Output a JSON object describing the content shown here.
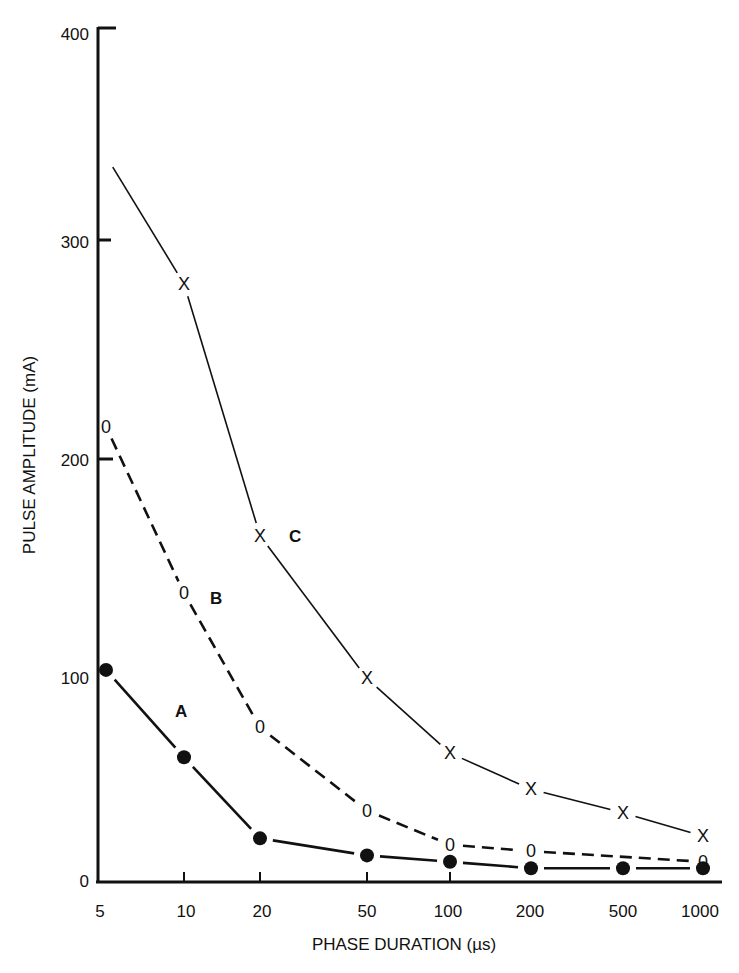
{
  "chart_data": {
    "type": "line",
    "title": "",
    "xlabel": "PHASE DURATION (µs)",
    "ylabel": "PULSE AMPLITUDE (mA)",
    "x_scale": "log",
    "x": [
      5,
      10,
      20,
      50,
      100,
      200,
      500,
      1000
    ],
    "x_tick_labels": [
      "5",
      "10",
      "20",
      "50",
      "100",
      "200",
      "500",
      "1000"
    ],
    "y_tick_labels": [
      "0",
      "100",
      "200",
      "300",
      "400"
    ],
    "ylim": [
      0,
      400
    ],
    "grid": false,
    "legend": "inline labels",
    "series": [
      {
        "name": "A",
        "marker": "filled-circle",
        "line": "solid",
        "values": [
          99,
          58,
          20,
          12,
          9,
          6,
          6,
          6
        ]
      },
      {
        "name": "B",
        "marker": "0",
        "line": "dashed",
        "values": [
          213,
          135,
          72,
          33,
          17,
          14,
          null,
          9
        ]
      },
      {
        "name": "C",
        "marker": "X",
        "line": "solid",
        "values": [
          340,
          280,
          162,
          95,
          60,
          43,
          32,
          21
        ]
      }
    ]
  }
}
